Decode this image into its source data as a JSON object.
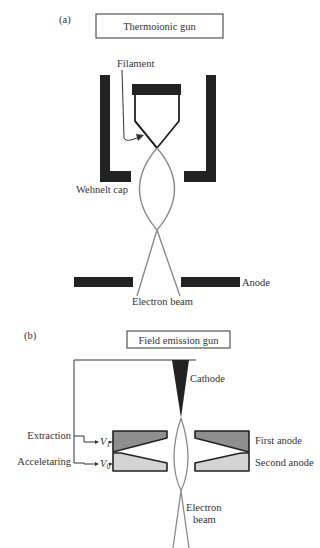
{
  "panel_a": {
    "label": "(a)",
    "title": "Thermoionic gun",
    "labels": {
      "filament": "Filament",
      "wehnelt_cap": "Wehnelt cap",
      "anode": "Anode",
      "electron_beam": "Electron beam"
    }
  },
  "panel_b": {
    "label": "(b)",
    "title": "Field emission gun",
    "labels": {
      "cathode": "Cathode",
      "extraction": "Extraction",
      "accelerating": "Acceletaring",
      "v1": "V",
      "v1_sub": "1",
      "v0": "V",
      "v0_sub": "0",
      "first_anode": "First anode",
      "second_anode": "Second anode",
      "electron_beam_line1": "Electron",
      "electron_beam_line2": "beam"
    }
  },
  "colors": {
    "black_parts": "#222222",
    "beam": "#8a8a8a",
    "first_anode_fill": "#8f8f8f",
    "second_anode_fill": "#d4d4d4",
    "text": "#333333"
  }
}
